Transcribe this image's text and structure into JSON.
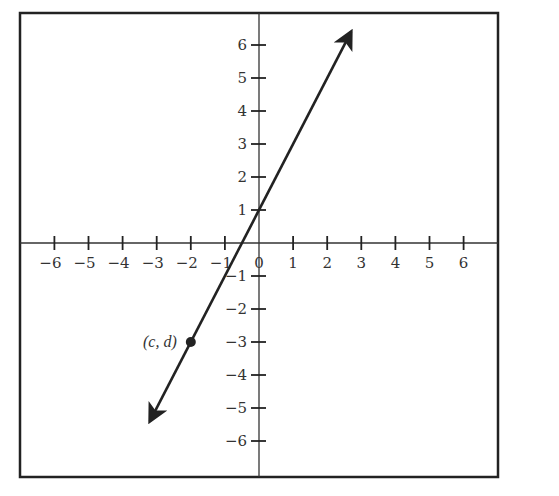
{
  "chart_data": {
    "type": "line",
    "title": "",
    "xlabel": "",
    "ylabel": "",
    "xlim": [
      -6.9,
      7.1
    ],
    "ylim": [
      -7.0,
      6.9
    ],
    "grid": false,
    "legend": null,
    "x_ticks": [
      -6,
      -5,
      -4,
      -3,
      -2,
      -1,
      0,
      1,
      2,
      3,
      4,
      5,
      6
    ],
    "x_tick_labels": [
      "−6",
      "−5",
      "−4",
      "−3",
      "−2",
      "−1",
      "0",
      "1",
      "2",
      "3",
      "4",
      "5",
      "6"
    ],
    "y_ticks": [
      6,
      5,
      4,
      3,
      2,
      1,
      -1,
      -2,
      -3,
      -4,
      -5,
      -6
    ],
    "y_tick_labels": [
      "6",
      "5",
      "4",
      "3",
      "2",
      "1",
      "−1",
      "−2",
      "−3",
      "−4",
      "−5",
      "−6"
    ],
    "series": [
      {
        "name": "line",
        "equation": "y = 2x + 1",
        "slope": 2,
        "intercept": 1,
        "x": [
          -3.2,
          2.7
        ],
        "y": [
          -5.4,
          6.4
        ],
        "arrows": "both"
      }
    ],
    "annotations": [
      {
        "label": "(c, d)",
        "x": -2,
        "y": -3,
        "marker": "filled-circle"
      }
    ],
    "origin_label": "0"
  },
  "frame": {
    "left": 20,
    "top": 13,
    "right": 498,
    "bottom": 477
  },
  "axes": {
    "origin_px": [
      259,
      243
    ],
    "unit_x_px": 34.1,
    "unit_y_px": 33.0
  },
  "colors": {
    "ink": "#222222",
    "background": "#ffffff"
  }
}
